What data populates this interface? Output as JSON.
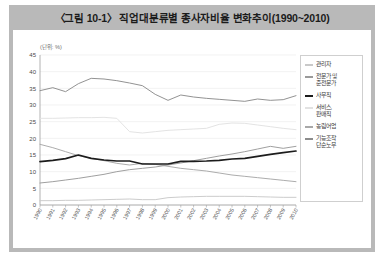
{
  "figure": {
    "title": "〈그림 10-1〉 직업대분류별 종사자비율 변화추이(1990~2010)",
    "unit_label": "(단위: %)",
    "frame_color": "#b9b9b9",
    "plate_color": "#ffffff"
  },
  "legend": {
    "position": "right",
    "items": [
      {
        "label": "관리자",
        "color": "#c9c9c9"
      },
      {
        "label": "전문가 및\n준전문가",
        "color": "#9a9a9a"
      },
      {
        "label": "사무직",
        "color": "#1c1c1c"
      },
      {
        "label": "서비스,\n판매직",
        "color": "#e2e2e2"
      },
      {
        "label": "농림어업",
        "color": "#a8a8a8"
      },
      {
        "label": "기능조작\n단순노무",
        "color": "#8c8c8c"
      }
    ]
  },
  "chart_data": {
    "type": "line",
    "title": "〈그림 10-1〉 직업대분류별 종사자비율 변화추이(1990~2010)",
    "xlabel": "",
    "ylabel": "",
    "unit": "(단위: %)",
    "grid": true,
    "legend_position": "right",
    "ylim": [
      0,
      45
    ],
    "yticks": [
      0,
      5,
      10,
      15,
      20,
      25,
      30,
      35,
      40,
      45
    ],
    "categories": [
      "1990",
      "1991",
      "1992",
      "1993",
      "1994",
      "1995",
      "1996",
      "1997",
      "1998",
      "1999",
      "2000",
      "2001",
      "2002",
      "2003",
      "2004",
      "2005",
      "2006",
      "2007",
      "2008",
      "2009",
      "2010"
    ],
    "series": [
      {
        "name": "관리자",
        "color": "#c9c9c9",
        "values": [
          1.3,
          1.3,
          1.4,
          1.4,
          1.5,
          1.6,
          1.7,
          1.8,
          1.6,
          1.6,
          2.2,
          2.4,
          2.5,
          2.6,
          2.6,
          2.6,
          2.6,
          2.5,
          2.4,
          2.3,
          2.3
        ]
      },
      {
        "name": "전문가 및 준전문가",
        "color": "#9a9a9a",
        "values": [
          6.6,
          7.0,
          7.5,
          8.0,
          8.6,
          9.2,
          10.0,
          10.6,
          11.0,
          11.4,
          12.0,
          12.6,
          13.3,
          14.0,
          14.7,
          15.3,
          16.0,
          16.8,
          17.6,
          17.0,
          17.6
        ]
      },
      {
        "name": "사무직",
        "color": "#1c1c1c",
        "values": [
          13.0,
          13.4,
          13.9,
          15.0,
          14.0,
          13.5,
          13.2,
          13.2,
          12.3,
          12.3,
          12.3,
          13.1,
          13.1,
          13.2,
          13.4,
          13.8,
          14.0,
          14.6,
          15.2,
          15.7,
          16.2
        ]
      },
      {
        "name": "서비스, 판매직",
        "color": "#e2e2e2",
        "values": [
          26.0,
          26.0,
          26.1,
          26.2,
          26.2,
          26.3,
          26.0,
          22.0,
          21.6,
          22.0,
          22.4,
          22.6,
          22.8,
          23.0,
          24.2,
          24.6,
          24.5,
          24.0,
          23.5,
          23.0,
          22.6
        ]
      },
      {
        "name": "농림어업",
        "color": "#a8a8a8",
        "values": [
          18.2,
          17.2,
          16.0,
          14.8,
          14.0,
          13.3,
          12.5,
          12.0,
          12.5,
          12.2,
          11.6,
          11.0,
          10.6,
          10.2,
          9.6,
          9.0,
          8.6,
          8.2,
          7.8,
          7.4,
          7.0
        ]
      },
      {
        "name": "기능조작 단순노무",
        "color": "#8c8c8c",
        "values": [
          34.3,
          35.2,
          34.0,
          36.4,
          38.0,
          37.8,
          37.3,
          36.6,
          35.8,
          33.2,
          31.4,
          33.0,
          32.4,
          32.0,
          31.7,
          31.4,
          31.1,
          31.8,
          31.4,
          31.6,
          32.8
        ]
      }
    ]
  }
}
